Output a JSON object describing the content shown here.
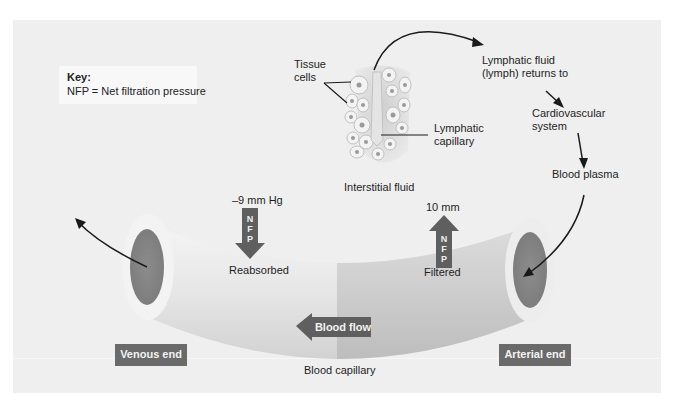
{
  "caption": {
    "text": "... blood plasma and interstitial fluid."
  },
  "key": {
    "title": "Key:",
    "text": "NFP = Net filtration pressure"
  },
  "labels": {
    "tissue_cells": [
      "Tissue",
      "cells"
    ],
    "lymphatic_capillary": [
      "Lymphatic",
      "capillary"
    ],
    "interstitial_fluid": "Interstitial fluid",
    "lymph_returns": [
      "Lymphatic fluid",
      "(lymph) returns to"
    ],
    "cardiovascular_system": [
      "Cardiovascular",
      "system"
    ],
    "blood_plasma": "Blood plasma",
    "venous_pressure": "–9 mm Hg",
    "arterial_pressure": "10 mm",
    "reabsorbed": "Reabsorbed",
    "filtered": "Filtered",
    "blood_flow": "Blood flow",
    "blood_capillary": "Blood capillary",
    "venous_end": "Venous end",
    "arterial_end": "Arterial end",
    "nfp_down": [
      "N",
      "F",
      "P"
    ],
    "nfp_up": [
      "N",
      "F",
      "P"
    ]
  },
  "colors": {
    "panel_bg": "#efefef",
    "tag_bg": "#6a6a6a",
    "arrow_fill": "#5f5f5f",
    "tube_light": "#e2e2e2",
    "tube_dark": "#c4c4c4",
    "lumen": "#8a8a8a"
  }
}
